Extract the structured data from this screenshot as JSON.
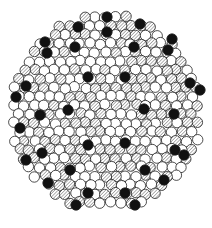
{
  "figure": {
    "width": 212,
    "height": 228,
    "outline": {
      "cx": 106,
      "cy": 112,
      "rx": 97,
      "ry": 100
    },
    "atom_radius": 5.2,
    "legend_types": [
      "white",
      "hatched",
      "black"
    ],
    "colors": {
      "white": "#ffffff",
      "hatched_line": "#555555",
      "black": "#111111",
      "stroke": "#222222"
    },
    "black_atoms": [
      [
        107,
        17
      ],
      [
        107,
        32
      ],
      [
        78,
        27
      ],
      [
        45,
        42
      ],
      [
        47,
        53
      ],
      [
        140,
        24
      ],
      [
        172,
        39
      ],
      [
        168,
        50
      ],
      [
        75,
        47
      ],
      [
        134,
        47
      ],
      [
        88,
        77
      ],
      [
        125,
        77
      ],
      [
        26,
        86
      ],
      [
        190,
        83
      ],
      [
        200,
        90
      ],
      [
        16,
        97
      ],
      [
        40,
        115
      ],
      [
        68,
        110
      ],
      [
        144,
        109
      ],
      [
        174,
        114
      ],
      [
        20,
        128
      ],
      [
        88,
        145
      ],
      [
        125,
        143
      ],
      [
        26,
        160
      ],
      [
        42,
        153
      ],
      [
        175,
        150
      ],
      [
        184,
        155
      ],
      [
        70,
        170
      ],
      [
        145,
        170
      ],
      [
        48,
        183
      ],
      [
        164,
        180
      ],
      [
        88,
        193
      ],
      [
        125,
        193
      ],
      [
        76,
        205
      ],
      [
        135,
        205
      ]
    ]
  }
}
